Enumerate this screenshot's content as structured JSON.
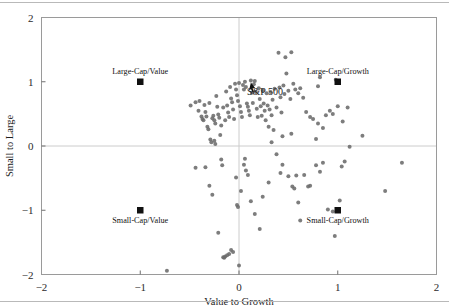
{
  "chart_data": {
    "type": "scatter",
    "title": "",
    "xlabel": "Value to Growth",
    "ylabel": "Small to Large",
    "xlim": [
      -2,
      2
    ],
    "ylim": [
      -2,
      2
    ],
    "xticks": [
      "-2",
      "-1",
      "0",
      "1",
      "2"
    ],
    "xtick_values": [
      -2,
      -1,
      0,
      1,
      2
    ],
    "yticks": [
      "-2",
      "-1",
      "0",
      "1",
      "2"
    ],
    "ytick_values": [
      -2,
      -1,
      0,
      1,
      2
    ],
    "grid": false,
    "reference_lines": {
      "x": 0,
      "y": 0,
      "color": "#cccccc"
    },
    "legend_position": "none",
    "point_color": "#6b6b6b",
    "point_radius": 2.0,
    "anchor_color": "#111111",
    "series": [
      {
        "name": "Funds",
        "marker": "circle",
        "color": "#6b6b6b",
        "points": [
          [
            -0.49,
            0.63
          ],
          [
            -0.44,
            0.68
          ],
          [
            -0.41,
            0.55
          ],
          [
            -0.4,
            0.7
          ],
          [
            -0.38,
            0.46
          ],
          [
            -0.37,
            0.42
          ],
          [
            -0.36,
            0.4
          ],
          [
            -0.35,
            0.64
          ],
          [
            -0.34,
            0.53
          ],
          [
            -0.33,
            0.46
          ],
          [
            -0.32,
            0.3
          ],
          [
            -0.31,
            0.26
          ],
          [
            -0.3,
            0.67
          ],
          [
            -0.29,
            0.1
          ],
          [
            -0.28,
            0.06
          ],
          [
            -0.27,
            0.43
          ],
          [
            -0.26,
            0.47
          ],
          [
            -0.25,
            0.4
          ],
          [
            -0.24,
            0.35
          ],
          [
            -0.23,
            0.78
          ],
          [
            -0.22,
            0.61
          ],
          [
            -0.21,
            0.49
          ],
          [
            -0.2,
            0.44
          ],
          [
            -0.19,
            0.17
          ],
          [
            -0.18,
            0.32
          ],
          [
            -0.16,
            0.6
          ],
          [
            -0.14,
            0.4
          ],
          [
            -0.13,
            0.85
          ],
          [
            -0.12,
            0.63
          ],
          [
            -0.11,
            0.52
          ],
          [
            -0.1,
            0.45
          ],
          [
            -0.09,
            0.92
          ],
          [
            -0.08,
            0.74
          ],
          [
            -0.07,
            0.68
          ],
          [
            -0.06,
            0.57
          ],
          [
            -0.05,
            0.42
          ],
          [
            -0.04,
            0.97
          ],
          [
            -0.03,
            0.88
          ],
          [
            -0.02,
            0.79
          ],
          [
            -0.01,
            0.7
          ],
          [
            0.0,
            0.98
          ],
          [
            0.01,
            0.62
          ],
          [
            0.02,
            0.53
          ],
          [
            0.03,
            0.45
          ],
          [
            0.04,
            0.95
          ],
          [
            0.05,
            0.88
          ],
          [
            0.06,
            1.0
          ],
          [
            0.07,
            0.92
          ],
          [
            0.08,
            0.66
          ],
          [
            0.09,
            0.61
          ],
          [
            0.1,
            0.55
          ],
          [
            0.11,
            0.48
          ],
          [
            0.12,
            1.02
          ],
          [
            0.13,
            0.83
          ],
          [
            0.14,
            0.67
          ],
          [
            0.15,
            0.96
          ],
          [
            0.16,
            1.01
          ],
          [
            0.17,
            0.84
          ],
          [
            0.18,
            0.58
          ],
          [
            0.19,
            0.45
          ],
          [
            0.2,
            0.9
          ],
          [
            0.21,
            0.73
          ],
          [
            0.22,
            0.62
          ],
          [
            0.23,
            0.47
          ],
          [
            0.24,
            0.86
          ],
          [
            0.25,
            0.66
          ],
          [
            0.26,
            0.55
          ],
          [
            0.27,
            0.4
          ],
          [
            0.28,
            0.82
          ],
          [
            0.29,
            0.63
          ],
          [
            0.3,
            0.3
          ],
          [
            0.31,
            0.57
          ],
          [
            0.32,
            0.84
          ],
          [
            0.33,
            0.48
          ],
          [
            0.34,
            0.72
          ],
          [
            0.35,
            0.25
          ],
          [
            0.36,
            0.89
          ],
          [
            0.38,
            0.6
          ],
          [
            0.4,
            1.45
          ],
          [
            0.41,
            0.91
          ],
          [
            0.42,
            0.76
          ],
          [
            0.43,
            0.52
          ],
          [
            0.44,
            0.15
          ],
          [
            0.45,
            0.94
          ],
          [
            0.46,
            0.81
          ],
          [
            0.47,
            1.38
          ],
          [
            0.48,
            1.13
          ],
          [
            0.5,
            0.86
          ],
          [
            0.52,
            0.73
          ],
          [
            0.53,
            1.46
          ],
          [
            0.55,
            0.97
          ],
          [
            0.57,
            0.88
          ],
          [
            0.6,
            0.82
          ],
          [
            0.62,
            0.9
          ],
          [
            0.65,
            0.75
          ],
          [
            0.68,
            0.53
          ],
          [
            0.72,
            0.45
          ],
          [
            0.75,
            0.42
          ],
          [
            0.8,
            0.93
          ],
          [
            0.82,
            1.07
          ],
          [
            0.85,
            0.28
          ],
          [
            0.88,
            0.48
          ],
          [
            0.92,
            0.55
          ],
          [
            0.95,
            0.5
          ],
          [
            0.98,
            1.03
          ],
          [
            1.0,
            0.62
          ],
          [
            1.05,
            0.38
          ],
          [
            1.1,
            0.6
          ],
          [
            1.25,
            0.16
          ],
          [
            1.12,
            -0.01
          ],
          [
            -0.44,
            -0.34
          ],
          [
            -0.34,
            -0.33
          ],
          [
            -0.3,
            -0.62
          ],
          [
            -0.27,
            -0.76
          ],
          [
            -0.21,
            -1.35
          ],
          [
            -0.17,
            -0.3
          ],
          [
            -0.18,
            -0.21
          ],
          [
            -0.16,
            -1.73
          ],
          [
            -0.15,
            -1.74
          ],
          [
            -0.14,
            -1.72
          ],
          [
            -0.12,
            -1.7
          ],
          [
            -0.1,
            -1.68
          ],
          [
            -0.08,
            -1.62
          ],
          [
            -0.06,
            -1.65
          ],
          [
            -0.03,
            -0.49
          ],
          [
            -0.02,
            -0.92
          ],
          [
            -0.01,
            -0.95
          ],
          [
            0.0,
            -1.86
          ],
          [
            0.02,
            -0.7
          ],
          [
            0.05,
            -0.29
          ],
          [
            0.06,
            -0.2
          ],
          [
            0.07,
            -0.38
          ],
          [
            0.09,
            -0.45
          ],
          [
            0.12,
            -0.86
          ],
          [
            0.16,
            -1.06
          ],
          [
            0.21,
            -1.29
          ],
          [
            0.24,
            -0.79
          ],
          [
            0.3,
            -0.57
          ],
          [
            0.38,
            -0.13
          ],
          [
            0.42,
            -0.42
          ],
          [
            0.44,
            -0.29
          ],
          [
            0.5,
            -0.47
          ],
          [
            0.54,
            -0.63
          ],
          [
            0.56,
            -0.66
          ],
          [
            0.58,
            -0.46
          ],
          [
            0.6,
            -0.88
          ],
          [
            0.62,
            -1.16
          ],
          [
            0.66,
            -0.45
          ],
          [
            0.7,
            -0.63
          ],
          [
            0.72,
            -0.62
          ],
          [
            0.78,
            -0.3
          ],
          [
            0.82,
            -0.4
          ],
          [
            0.85,
            -0.26
          ],
          [
            0.9,
            -0.99
          ],
          [
            0.95,
            -1.02
          ],
          [
            0.97,
            -1.4
          ],
          [
            1.02,
            -0.85
          ],
          [
            1.04,
            -0.32
          ],
          [
            1.07,
            -0.24
          ],
          [
            1.48,
            -0.7
          ],
          [
            1.65,
            -0.26
          ],
          [
            -0.73,
            -1.94
          ],
          [
            -0.24,
            0.03
          ],
          [
            -0.25,
            0.08
          ],
          [
            0.33,
            0.06
          ],
          [
            0.53,
            0.19
          ],
          [
            0.78,
            0.11
          ],
          [
            0.8,
            0.35
          ]
        ]
      }
    ],
    "anchors": [
      {
        "name": "Large-Cap/Value",
        "label": "Large-Cap/Value",
        "x": -1,
        "y": 1,
        "label_position": "above",
        "marker": "square"
      },
      {
        "name": "Large-Cap/Growth",
        "label": "Large-Cap/Growth",
        "x": 1,
        "y": 1,
        "label_position": "above",
        "marker": "square"
      },
      {
        "name": "Small-Cap/Value",
        "label": "Small-Cap/Value",
        "x": -1,
        "y": -1,
        "label_position": "below",
        "marker": "square"
      },
      {
        "name": "Small-Cap/Growth",
        "label": "Small-Cap/Growth",
        "x": 1,
        "y": -1,
        "label_position": "below",
        "marker": "square"
      }
    ],
    "annotations": [
      {
        "name": "sp500",
        "text": "S&P 500",
        "x": 0.08,
        "y": 0.86,
        "pointer_x": 0.12,
        "pointer_y": 0.99,
        "marker": "arrow"
      }
    ]
  }
}
